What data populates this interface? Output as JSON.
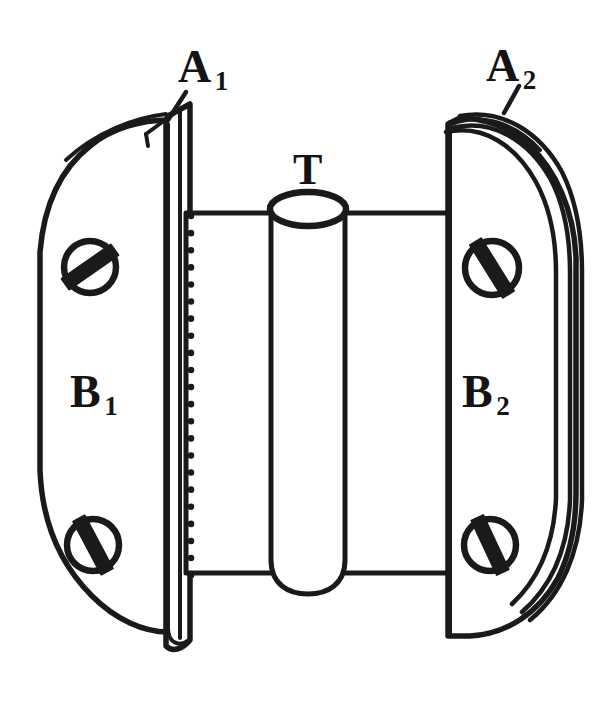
{
  "figure": {
    "kind": "technical-line-drawing",
    "background_color": "#ffffff",
    "ink_color": "#1a1a1a",
    "width": 611,
    "height": 717
  },
  "labels": {
    "a1": {
      "main": "A",
      "sub": "1",
      "full": "A₁"
    },
    "a2": {
      "main": "A",
      "sub": "2",
      "full": "A₂"
    },
    "t": {
      "main": "T",
      "sub": "",
      "full": "T"
    },
    "b1": {
      "main": "B",
      "sub": "1",
      "full": "B₁"
    },
    "b2": {
      "main": "B",
      "sub": "2",
      "full": "B₂"
    }
  },
  "parts": {
    "left_plate": {
      "name": "left-pole-plate",
      "label": "B₁",
      "screw_count": 2
    },
    "right_plate": {
      "name": "right-pole-plate",
      "label": "B₂",
      "screw_count": 2
    },
    "left_edge_strip": {
      "name": "left-edge-strip",
      "label": "A₁"
    },
    "right_edge_layers": {
      "name": "right-edge-layers",
      "label": "A₂",
      "layer_count": 3
    },
    "core_cylinder": {
      "name": "core-cylinder",
      "label": "T"
    },
    "coil_body": {
      "name": "coil-body",
      "label": ""
    },
    "hidden_line": {
      "name": "hidden-edge-dotted-line",
      "style": "dotted"
    }
  },
  "screws": [
    {
      "name": "screw-top-left",
      "cx": 90,
      "cy": 267,
      "r": 26,
      "slot_angle_deg": -35
    },
    {
      "name": "screw-bottom-left",
      "cx": 93,
      "cy": 545,
      "r": 26,
      "slot_angle_deg": 62
    },
    {
      "name": "screw-top-right",
      "cx": 492,
      "cy": 268,
      "r": 27,
      "slot_angle_deg": 58
    },
    {
      "name": "screw-bottom-right",
      "cx": 490,
      "cy": 545,
      "r": 26,
      "slot_angle_deg": 65
    }
  ]
}
